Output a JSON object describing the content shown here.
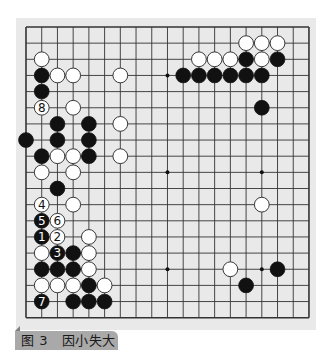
{
  "figure": {
    "caption_label": "图 3",
    "caption_title": "因小失大",
    "caption_full": "图 3   因小失大"
  },
  "board": {
    "size": 19,
    "origin_x": 26,
    "origin_y": 27,
    "spacing_x": 15.72,
    "spacing_y": 16.15,
    "stone_radius": 7.4,
    "colors": {
      "panel_bg": "#e9e9e9",
      "line": "#333333",
      "black_stone": "#111111",
      "white_stone": "#ffffff",
      "white_stone_edge": "#222222"
    },
    "hoshi": [
      [
        3,
        3
      ],
      [
        9,
        3
      ],
      [
        15,
        3
      ],
      [
        3,
        9
      ],
      [
        9,
        9
      ],
      [
        15,
        9
      ],
      [
        3,
        15
      ],
      [
        9,
        15
      ],
      [
        15,
        15
      ]
    ],
    "black_stones": [
      {
        "col": 10,
        "row": 3
      },
      {
        "col": 11,
        "row": 3
      },
      {
        "col": 12,
        "row": 3
      },
      {
        "col": 13,
        "row": 3
      },
      {
        "col": 14,
        "row": 3
      },
      {
        "col": 15,
        "row": 3
      },
      {
        "col": 14,
        "row": 2
      },
      {
        "col": 16,
        "row": 2
      },
      {
        "col": 15,
        "row": 5
      },
      {
        "col": 1,
        "row": 3
      },
      {
        "col": 1,
        "row": 4
      },
      {
        "col": 2,
        "row": 6
      },
      {
        "col": 4,
        "row": 6
      },
      {
        "col": 0,
        "row": 7
      },
      {
        "col": 2,
        "row": 7
      },
      {
        "col": 4,
        "row": 7
      },
      {
        "col": 1,
        "row": 8
      },
      {
        "col": 4,
        "row": 8
      },
      {
        "col": 2,
        "row": 10
      },
      {
        "col": 1,
        "row": 12,
        "label": "5"
      },
      {
        "col": 1,
        "row": 13,
        "label": "1"
      },
      {
        "col": 2,
        "row": 14,
        "label": "3"
      },
      {
        "col": 3,
        "row": 14
      },
      {
        "col": 1,
        "row": 15
      },
      {
        "col": 2,
        "row": 15
      },
      {
        "col": 3,
        "row": 15
      },
      {
        "col": 4,
        "row": 16
      },
      {
        "col": 1,
        "row": 17,
        "label": "7"
      },
      {
        "col": 3,
        "row": 17
      },
      {
        "col": 4,
        "row": 17
      },
      {
        "col": 5,
        "row": 17
      },
      {
        "col": 16,
        "row": 15
      },
      {
        "col": 14,
        "row": 16
      }
    ],
    "white_stones": [
      {
        "col": 14,
        "row": 1
      },
      {
        "col": 15,
        "row": 1
      },
      {
        "col": 16,
        "row": 1
      },
      {
        "col": 11,
        "row": 2
      },
      {
        "col": 12,
        "row": 2
      },
      {
        "col": 13,
        "row": 2
      },
      {
        "col": 15,
        "row": 2
      },
      {
        "col": 1,
        "row": 2
      },
      {
        "col": 2,
        "row": 3
      },
      {
        "col": 3,
        "row": 3
      },
      {
        "col": 6,
        "row": 3
      },
      {
        "col": 1,
        "row": 5,
        "label": "8"
      },
      {
        "col": 3,
        "row": 5
      },
      {
        "col": 6,
        "row": 6
      },
      {
        "col": 2,
        "row": 8
      },
      {
        "col": 3,
        "row": 8
      },
      {
        "col": 6,
        "row": 8
      },
      {
        "col": 1,
        "row": 9
      },
      {
        "col": 3,
        "row": 9
      },
      {
        "col": 1,
        "row": 11,
        "label": "4"
      },
      {
        "col": 3,
        "row": 11
      },
      {
        "col": 2,
        "row": 12,
        "label": "6"
      },
      {
        "col": 2,
        "row": 13,
        "label": "2"
      },
      {
        "col": 4,
        "row": 13
      },
      {
        "col": 1,
        "row": 14
      },
      {
        "col": 4,
        "row": 14
      },
      {
        "col": 4,
        "row": 15
      },
      {
        "col": 1,
        "row": 16
      },
      {
        "col": 2,
        "row": 16
      },
      {
        "col": 3,
        "row": 16
      },
      {
        "col": 5,
        "row": 16
      },
      {
        "col": 15,
        "row": 11
      },
      {
        "col": 13,
        "row": 15
      }
    ]
  }
}
